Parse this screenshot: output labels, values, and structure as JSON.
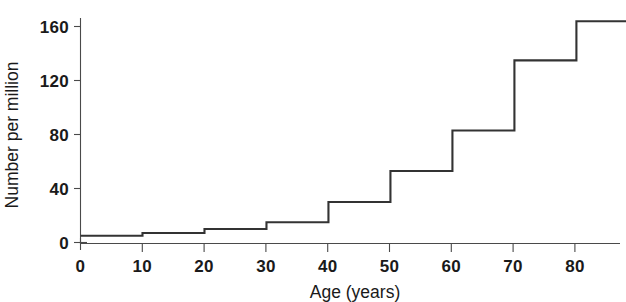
{
  "chart_data": {
    "type": "line",
    "subtype": "step",
    "title": "",
    "xlabel": "Age (years)",
    "ylabel": "Number per million",
    "xlim": [
      0,
      88
    ],
    "ylim": [
      0,
      172
    ],
    "xticks": [
      0,
      10,
      20,
      30,
      40,
      50,
      60,
      70,
      80
    ],
    "yticks": [
      0,
      40,
      80,
      120,
      160
    ],
    "xtick_labels": [
      "0",
      "10",
      "20",
      "30",
      "40",
      "50",
      "60",
      "70",
      "80"
    ],
    "ytick_labels": [
      "0",
      "40",
      "80",
      "120",
      "160"
    ],
    "grid": false,
    "legend": null,
    "series": [
      {
        "name": "Number per million",
        "step_mode": "post",
        "bins": [
          {
            "x_start": 0,
            "x_end": 10,
            "value": 5
          },
          {
            "x_start": 10,
            "x_end": 20,
            "value": 7
          },
          {
            "x_start": 20,
            "x_end": 30,
            "value": 10
          },
          {
            "x_start": 30,
            "x_end": 40,
            "value": 15
          },
          {
            "x_start": 40,
            "x_end": 50,
            "value": 30
          },
          {
            "x_start": 50,
            "x_end": 60,
            "value": 53
          },
          {
            "x_start": 60,
            "x_end": 70,
            "value": 83
          },
          {
            "x_start": 70,
            "x_end": 80,
            "value": 135
          },
          {
            "x_start": 80,
            "x_end": 88,
            "value": 164
          }
        ],
        "x": [
          0,
          10,
          20,
          30,
          40,
          50,
          60,
          70,
          80,
          88
        ],
        "values": [
          5,
          7,
          10,
          15,
          30,
          53,
          83,
          135,
          164,
          164
        ],
        "color": "#333333"
      }
    ]
  },
  "axes": {
    "x_title": "Age (years)",
    "y_title": "Number per million"
  }
}
